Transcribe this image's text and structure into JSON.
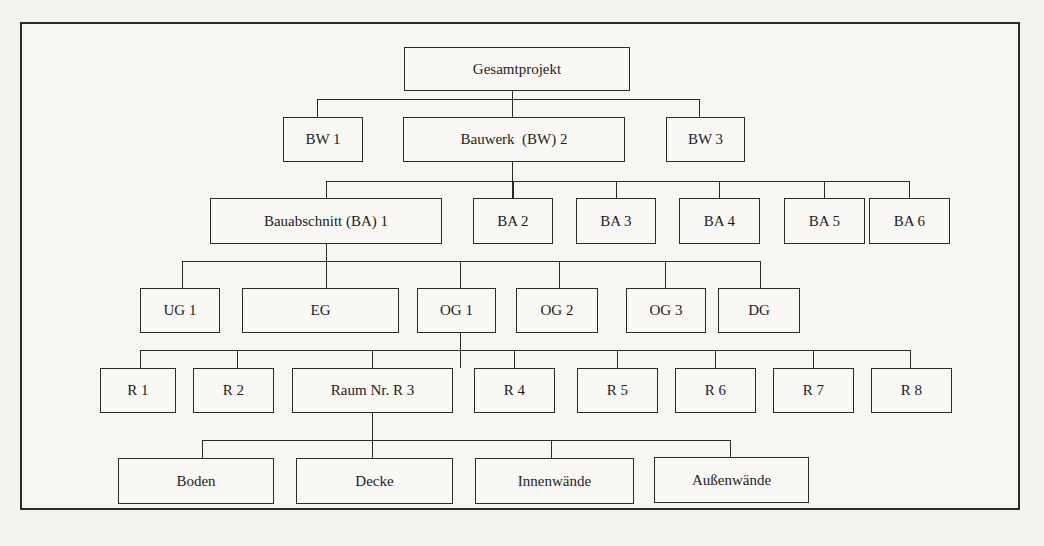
{
  "diagram": {
    "type": "hierarchy-tree",
    "root": {
      "label": "Gesamtprojekt"
    },
    "level1": [
      {
        "label": "BW 1"
      },
      {
        "label": "Bauwerk  (BW) 2"
      },
      {
        "label": "BW 3"
      }
    ],
    "level2": [
      {
        "label": "Bauabschnitt (BA) 1"
      },
      {
        "label": "BA 2"
      },
      {
        "label": "BA 3"
      },
      {
        "label": "BA 4"
      },
      {
        "label": "BA 5"
      },
      {
        "label": "BA 6"
      }
    ],
    "level3": [
      {
        "label": "UG 1"
      },
      {
        "label": "EG"
      },
      {
        "label": "OG 1"
      },
      {
        "label": "OG 2"
      },
      {
        "label": "OG 3"
      },
      {
        "label": "DG"
      }
    ],
    "level4": [
      {
        "label": "R 1"
      },
      {
        "label": "R 2"
      },
      {
        "label": "Raum Nr. R 3"
      },
      {
        "label": "R 4"
      },
      {
        "label": "R 5"
      },
      {
        "label": "R 6"
      },
      {
        "label": "R 7"
      },
      {
        "label": "R 8"
      }
    ],
    "level5": [
      {
        "label": "Boden"
      },
      {
        "label": "Decke"
      },
      {
        "label": "Innenwände"
      },
      {
        "label": "Außenwände"
      }
    ],
    "expanded_path": [
      "Gesamtprojekt",
      "Bauwerk  (BW) 2",
      "Bauabschnitt (BA) 1",
      "OG 1",
      "Raum Nr. R 3"
    ]
  }
}
